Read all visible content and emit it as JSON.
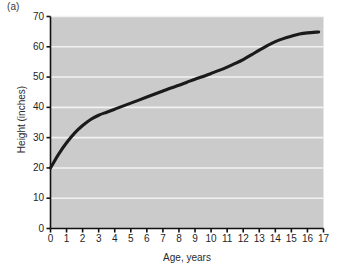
{
  "panel": {
    "label": "(a)"
  },
  "axes": {
    "xlabel": "Age, years",
    "ylabel": "Height (inches)",
    "x_ticks": [
      "0",
      "1",
      "2",
      "3",
      "4",
      "5",
      "6",
      "7",
      "8",
      "9",
      "10",
      "11",
      "12",
      "13",
      "14",
      "15",
      "16",
      "17"
    ],
    "y_ticks": [
      "0",
      "10",
      "20",
      "30",
      "40",
      "50",
      "60",
      "70"
    ]
  },
  "colors": {
    "plot_background": "#cbcbcb",
    "gridline": "#f2f2f2",
    "curve": "#1a1a1a",
    "axis": "#111111",
    "text": "#1f1f1f",
    "page_background": "#ffffff"
  },
  "chart_data": {
    "type": "line",
    "title": "",
    "xlabel": "Age, years",
    "ylabel": "Height (inches)",
    "xlim": [
      0,
      17
    ],
    "ylim": [
      0,
      70
    ],
    "xticks": [
      0,
      1,
      2,
      3,
      4,
      5,
      6,
      7,
      8,
      9,
      10,
      11,
      12,
      13,
      14,
      15,
      16,
      17
    ],
    "yticks": [
      0,
      10,
      20,
      30,
      40,
      50,
      60,
      70
    ],
    "grid": "horizontal",
    "legend": "none",
    "series": [
      {
        "name": "Height",
        "x": [
          0,
          0.5,
          1,
          1.5,
          2,
          2.5,
          3,
          3.5,
          4,
          4.5,
          5,
          5.5,
          6,
          6.5,
          7,
          7.5,
          8,
          8.5,
          9,
          9.5,
          10,
          10.5,
          11,
          11.5,
          12,
          12.5,
          13,
          13.5,
          14,
          14.5,
          15,
          15.5,
          16,
          16.7
        ],
        "y": [
          20.0,
          24.5,
          28.3,
          31.5,
          34.0,
          36.0,
          37.4,
          38.4,
          39.4,
          40.4,
          41.4,
          42.4,
          43.4,
          44.4,
          45.4,
          46.4,
          47.3,
          48.3,
          49.3,
          50.2,
          51.2,
          52.2,
          53.3,
          54.5,
          55.8,
          57.3,
          58.9,
          60.4,
          61.7,
          62.7,
          63.5,
          64.2,
          64.6,
          64.9
        ]
      }
    ]
  }
}
